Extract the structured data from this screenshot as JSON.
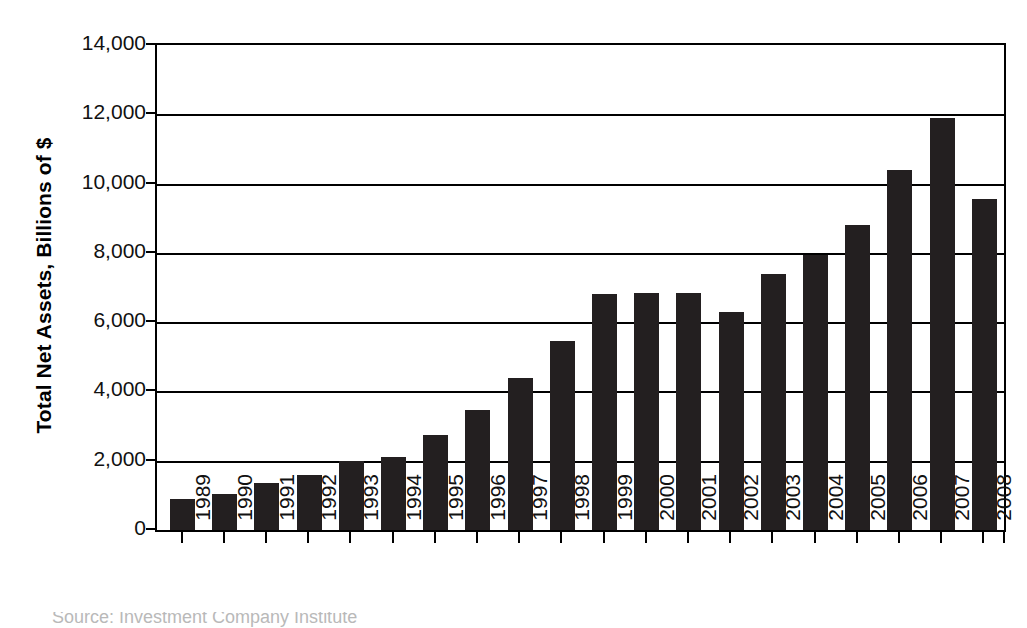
{
  "chart_data": {
    "type": "bar",
    "title": "",
    "xlabel": "",
    "ylabel": "Total Net Assets, Billions of $",
    "ylim": [
      0,
      14000
    ],
    "ytick_step": 2000,
    "ytick_labels": [
      "14,000",
      "12,000",
      "10,000",
      "8,000",
      "6,000",
      "4,000",
      "2,000",
      "0"
    ],
    "ytick_values": [
      14000,
      12000,
      10000,
      8000,
      6000,
      4000,
      2000,
      0
    ],
    "grid": "horizontal",
    "legend": "none",
    "bar_color": "#231f20",
    "categories": [
      "1989",
      "1990",
      "1991",
      "1992",
      "1993",
      "1994",
      "1995",
      "1996",
      "1997",
      "1998",
      "1999",
      "2000",
      "2001",
      "2002",
      "2003",
      "2004",
      "2005",
      "2006",
      "2007",
      "2008"
    ],
    "values": [
      900,
      1050,
      1350,
      1600,
      2000,
      2100,
      2750,
      3450,
      4400,
      5450,
      6800,
      6850,
      6850,
      6300,
      7400,
      7950,
      8800,
      10400,
      11900,
      9550
    ],
    "xtick_rotation": -90
  },
  "axis": {
    "y_title": "Total Net Assets, Billions of $"
  },
  "caption": {
    "clipped_text": "Source: Investment Company Institute"
  }
}
